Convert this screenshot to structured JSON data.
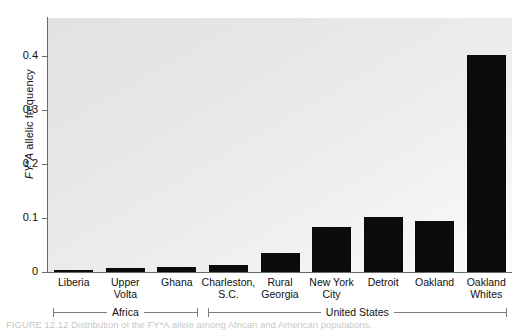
{
  "figure": {
    "background_color": "#ffffff",
    "plot_background_color": "#e9e9e9",
    "bar_color": "#0b0b0b",
    "axis_color": "#6a6a6a"
  },
  "yaxis": {
    "label_prefix": "FY*A",
    "label_rest": " allelic frequency",
    "ticks": [
      "0",
      "0.1",
      "0.2",
      "0.3",
      "0.4"
    ],
    "tick_values": [
      0,
      0.1,
      0.2,
      0.3,
      0.4
    ],
    "min": 0,
    "max": 0.47
  },
  "groups": [
    {
      "name": "Africa",
      "label": "Africa",
      "first_index": 0,
      "last_index": 2
    },
    {
      "name": "United States",
      "label": "United States",
      "first_index": 3,
      "last_index": 8
    }
  ],
  "caption": {
    "visible_fragment": "FIGURE 12.12  Distribution of the FY*A allele among African and American populations."
  },
  "chart_data": {
    "type": "bar",
    "title": "",
    "xlabel": "",
    "ylabel": "FY*A allelic frequency",
    "ylim": [
      0,
      0.47
    ],
    "grid": false,
    "legend": "none",
    "categories": [
      "Liberia",
      "Upper Volta",
      "Ghana",
      "Charleston, S.C.",
      "Rural Georgia",
      "New York City",
      "Detroit",
      "Oakland",
      "Oakland Whites"
    ],
    "category_lines": [
      [
        "Liberia"
      ],
      [
        "Upper",
        "Volta"
      ],
      [
        "Ghana"
      ],
      [
        "Charleston,",
        "S.C."
      ],
      [
        "Rural",
        "Georgia"
      ],
      [
        "New York",
        "City"
      ],
      [
        "Detroit"
      ],
      [
        "Oakland"
      ],
      [
        "Oakland",
        "Whites"
      ]
    ],
    "values": [
      0.003,
      0.007,
      0.009,
      0.013,
      0.035,
      0.084,
      0.101,
      0.094,
      0.402
    ],
    "group_of_category": [
      "Africa",
      "Africa",
      "Africa",
      "United States",
      "United States",
      "United States",
      "United States",
      "United States",
      "United States"
    ]
  }
}
